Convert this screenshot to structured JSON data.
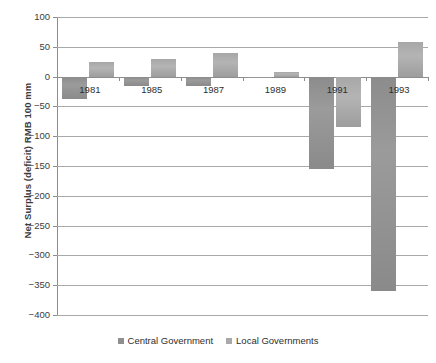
{
  "chart_data": {
    "type": "bar",
    "title": "",
    "subtitle": "",
    "xlabel": "",
    "ylabel": "Net Surplus (deficit) RMB 100 mm",
    "categories": [
      "1981",
      "1985",
      "1987",
      "1989",
      "1991",
      "1993"
    ],
    "series": [
      {
        "name": "Central Government",
        "color": "#8f8f8f",
        "values": [
          -38,
          -16,
          -15,
          -2,
          -155,
          -360
        ]
      },
      {
        "name": "Local Governments",
        "color": "#a9a9a9",
        "values": [
          24,
          30,
          40,
          7,
          -85,
          58
        ]
      }
    ],
    "ylim": [
      -400,
      100
    ],
    "yticks": [
      100,
      50,
      0,
      -50,
      -100,
      -150,
      -200,
      -250,
      -300,
      -350,
      -400
    ],
    "ytick_labels": [
      "100",
      "50",
      "0",
      "−50",
      "−100",
      "−150",
      "−200",
      "−250",
      "−300",
      "−350",
      "−400"
    ],
    "grid": true,
    "legend_position": "bottom",
    "legend": [
      "Central Government",
      "Local Governments"
    ]
  }
}
